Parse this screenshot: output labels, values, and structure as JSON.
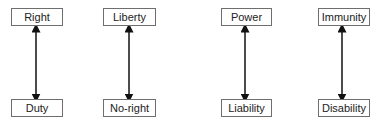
{
  "diagram": {
    "type": "hohfeldian-correlatives",
    "pairs": [
      {
        "top": "Right",
        "bottom": "Duty",
        "x": 11,
        "w": 52,
        "arrow_x": 36
      },
      {
        "top": "Liberty",
        "bottom": "No-right",
        "x": 103,
        "w": 53,
        "arrow_x": 129
      },
      {
        "top": "Power",
        "bottom": "Liability",
        "x": 221,
        "w": 51,
        "arrow_x": 245
      },
      {
        "top": "Immunity",
        "bottom": "Disability",
        "x": 318,
        "w": 52,
        "arrow_x": 342
      }
    ],
    "edges": [
      {
        "from": "Right",
        "to": "Duty",
        "style": "double-arrow"
      },
      {
        "from": "Liberty",
        "to": "No-right",
        "style": "double-arrow"
      },
      {
        "from": "Power",
        "to": "Liability",
        "style": "double-arrow"
      },
      {
        "from": "Immunity",
        "to": "Disability",
        "style": "double-arrow"
      }
    ],
    "colors": {
      "border": "#6e6e6e",
      "arrow": "#111111",
      "text": "#222222"
    }
  }
}
